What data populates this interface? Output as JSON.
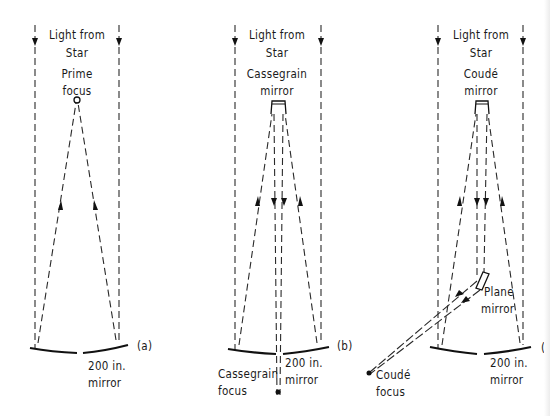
{
  "panels": [
    {
      "id": "a",
      "tag": "(a)",
      "incoming_label_line1": "Light from",
      "incoming_label_line2": "Star",
      "focus_label_line1": "Prime",
      "focus_label_line2": "focus",
      "mirror_label_line1": "200 in.",
      "mirror_label_line2": "mirror"
    },
    {
      "id": "b",
      "tag": "(b)",
      "incoming_label_line1": "Light from",
      "incoming_label_line2": "Star",
      "secondary_label_line1": "Cassegrain",
      "secondary_label_line2": "mirror",
      "mirror_label_line1": "200 in.",
      "mirror_label_line2": "mirror",
      "focus_label_line1": "Cassegrain",
      "focus_label_line2": "focus"
    },
    {
      "id": "c",
      "tag": "(c",
      "incoming_label_line1": "Light from",
      "incoming_label_line2": "Star",
      "secondary_label_line1": "Coudé",
      "secondary_label_line2": "mirror",
      "plane_label_line1": "Plane",
      "plane_label_line2": "mirror",
      "mirror_label_line1": "200 in.",
      "mirror_label_line2": "mirror",
      "focus_label_line1": "Coudé",
      "focus_label_line2": "focus"
    }
  ],
  "colors": {
    "ink": "#111111",
    "background": "#ffffff"
  }
}
